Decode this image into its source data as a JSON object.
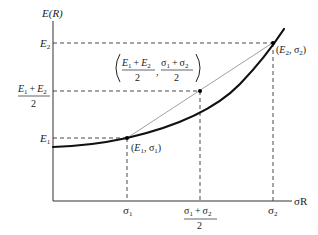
{
  "diagram": {
    "y_axis_label": "E(R)",
    "x_axis_label": "σR",
    "y_ticks": {
      "e2": "E",
      "e2_sub": "2",
      "mid_num_e1": "E",
      "mid_num_e1_sub": "1",
      "mid_num_plus": "+",
      "mid_num_e2": "E",
      "mid_num_e2_sub": "2",
      "mid_den": "2",
      "e1": "E",
      "e1_sub": "1"
    },
    "x_ticks": {
      "s1": "σ",
      "s1_sub": "1",
      "mid_num_s1": "σ",
      "mid_num_s1_sub": "1",
      "mid_num_plus": "+",
      "mid_num_s2": "σ",
      "mid_num_s2_sub": "2",
      "mid_den": "2",
      "s2": "σ",
      "s2_sub": "2"
    },
    "points": {
      "p1": {
        "open": "(",
        "e": "E",
        "e_sub": "1",
        "comma": ", ",
        "s": "σ",
        "s_sub": "1",
        "close": ")"
      },
      "p2": {
        "open": "(",
        "e": "E",
        "e_sub": "2",
        "comma": ", ",
        "s": "σ",
        "s_sub": "2",
        "close": ")"
      },
      "mid": {
        "e1": "E",
        "e1_sub": "1",
        "plus1": "+",
        "e2": "E",
        "e2_sub": "2",
        "den1": "2",
        "comma": ",",
        "s1": "σ",
        "s1_sub": "1",
        "plus2": "+",
        "s2": "σ",
        "s2_sub": "2",
        "den2": "2"
      }
    },
    "colors": {
      "curve": "#111111",
      "chord": "#888888",
      "dashed": "#333333",
      "axis": "#333333"
    }
  }
}
